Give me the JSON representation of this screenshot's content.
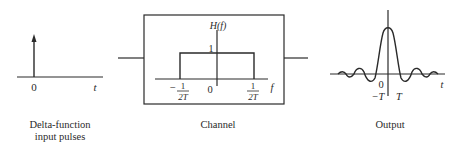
{
  "input_panel": {
    "zero_label": "0",
    "axis_label": "t",
    "caption_line1": "Delta-function",
    "caption_line2": "input pulses"
  },
  "channel_panel": {
    "function_label": "H(f)",
    "unit_label": "1",
    "zero_label": "0",
    "axis_label": "f",
    "neg_edge_sign": "−",
    "edge_numerator": "1",
    "edge_denominator": "2T",
    "caption": "Channel"
  },
  "output_panel": {
    "zero_label": "0",
    "neg_T_label": "−T",
    "pos_T_label": "T",
    "axis_label": "t",
    "caption": "Output"
  },
  "colors": {
    "stroke": "#2a2a2a",
    "background": "#ffffff"
  }
}
